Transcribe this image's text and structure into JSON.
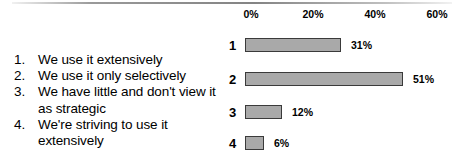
{
  "chart_data": {
    "type": "bar",
    "orientation": "horizontal",
    "title": "",
    "xlabel": "",
    "ylabel": "",
    "xlim": [
      0,
      60
    ],
    "grid": false,
    "legend_position": "left",
    "categories": [
      "1",
      "2",
      "3",
      "4"
    ],
    "category_labels": [
      "We use it extensively",
      "We use it only selectively",
      "We have little and don't view it as strategic",
      "We're striving to use it extensively"
    ],
    "values": [
      31,
      51,
      12,
      6
    ],
    "value_labels": [
      "31%",
      "51%",
      "12%",
      "6%"
    ],
    "tick_values": [
      0,
      20,
      40,
      60
    ],
    "tick_labels": [
      "0%",
      "20%",
      "40%",
      "60%"
    ],
    "bar_fill_color": "#a9a9a9",
    "bar_border_color": "#3a3a3a"
  },
  "legend": {
    "items": [
      {
        "number": "1.",
        "text": "We use it extensively"
      },
      {
        "number": "2.",
        "text": "We use it only selectively"
      },
      {
        "number": "3.",
        "text": "We have little and don't view it as strategic"
      },
      {
        "number": "4.",
        "text": "We're striving to use it extensively"
      }
    ]
  }
}
